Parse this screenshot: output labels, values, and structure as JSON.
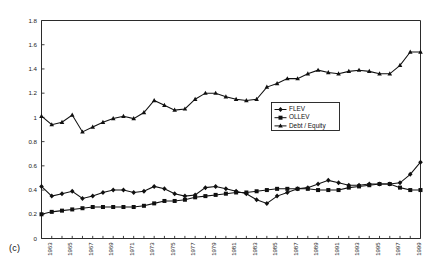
{
  "panel": {
    "label": "(c)"
  },
  "legend": {
    "position": "inside-right-middle",
    "entries": [
      {
        "label": "FLEV",
        "marker": "diamond"
      },
      {
        "label": "OLLEV",
        "marker": "square"
      },
      {
        "label": "Debt / Equity",
        "marker": "triangle"
      }
    ]
  },
  "axes": {
    "y_ticks": [
      "0",
      "0.2",
      "0.4",
      "0.6",
      "0.8",
      "1",
      "1.2",
      "1.4",
      "1.6",
      "1.8"
    ],
    "x_ticks": [
      "1963",
      "1965",
      "1967",
      "1969",
      "1971",
      "1973",
      "1975",
      "1977",
      "1979",
      "1981",
      "1983",
      "1985",
      "1987",
      "1989",
      "1991",
      "1993",
      "1995",
      "1997",
      "1999"
    ]
  },
  "chart_data": {
    "type": "line",
    "title": "",
    "subtitle": "",
    "xlabel": "",
    "ylabel": "",
    "ylim": [
      0,
      1.8
    ],
    "ytick_step": 0.2,
    "grid": false,
    "legend_position": "inside-right-middle",
    "annotations": [
      "(c)"
    ],
    "x": [
      1962,
      1963,
      1964,
      1965,
      1966,
      1967,
      1968,
      1969,
      1970,
      1971,
      1972,
      1973,
      1974,
      1975,
      1976,
      1977,
      1978,
      1979,
      1980,
      1981,
      1982,
      1983,
      1984,
      1985,
      1986,
      1987,
      1988,
      1989,
      1990,
      1991,
      1992,
      1993,
      1994,
      1995,
      1996,
      1997,
      1998,
      1999
    ],
    "xtick_labels": [
      "1963",
      "1965",
      "1967",
      "1969",
      "1971",
      "1973",
      "1975",
      "1977",
      "1979",
      "1981",
      "1983",
      "1985",
      "1987",
      "1989",
      "1991",
      "1993",
      "1995",
      "1997",
      "1999"
    ],
    "series": [
      {
        "name": "Debt / Equity",
        "marker": "triangle",
        "values": [
          1.01,
          0.94,
          0.96,
          1.02,
          0.88,
          0.92,
          0.96,
          0.99,
          1.01,
          0.99,
          1.04,
          1.14,
          1.1,
          1.06,
          1.07,
          1.15,
          1.2,
          1.2,
          1.17,
          1.15,
          1.14,
          1.15,
          1.25,
          1.28,
          1.32,
          1.32,
          1.36,
          1.39,
          1.37,
          1.36,
          1.38,
          1.39,
          1.38,
          1.36,
          1.36,
          1.43,
          1.54,
          1.54
        ]
      },
      {
        "name": "FLEV",
        "marker": "diamond",
        "values": [
          0.43,
          0.35,
          0.37,
          0.39,
          0.33,
          0.35,
          0.38,
          0.4,
          0.4,
          0.38,
          0.39,
          0.43,
          0.41,
          0.37,
          0.35,
          0.36,
          0.42,
          0.43,
          0.41,
          0.39,
          0.37,
          0.32,
          0.29,
          0.35,
          0.38,
          0.41,
          0.42,
          0.45,
          0.48,
          0.46,
          0.44,
          0.44,
          0.45,
          0.45,
          0.45,
          0.46,
          0.53,
          0.63
        ]
      },
      {
        "name": "OLLEV",
        "marker": "square",
        "values": [
          0.2,
          0.22,
          0.23,
          0.24,
          0.25,
          0.26,
          0.26,
          0.26,
          0.26,
          0.26,
          0.27,
          0.29,
          0.31,
          0.31,
          0.32,
          0.34,
          0.35,
          0.36,
          0.37,
          0.38,
          0.38,
          0.39,
          0.4,
          0.41,
          0.41,
          0.41,
          0.41,
          0.4,
          0.4,
          0.4,
          0.42,
          0.43,
          0.44,
          0.45,
          0.45,
          0.42,
          0.4,
          0.4
        ]
      }
    ]
  }
}
